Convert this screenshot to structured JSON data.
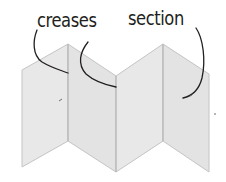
{
  "diagram": {
    "labels": {
      "creases": "creases",
      "section": "section"
    },
    "colors": {
      "panel_fill": "#e6e6e6",
      "panel_stroke": "#bdbdbd",
      "leader_line": "#231f20",
      "text": "#231f20",
      "background": "#ffffff"
    },
    "panels": [
      {
        "id": 1,
        "points": "22,70 68,44 68,141 22,167"
      },
      {
        "id": 2,
        "points": "68,44 116,76 116,172 68,141"
      },
      {
        "id": 3,
        "points": "116,76 163,44 163,141 116,172"
      },
      {
        "id": 4,
        "points": "163,44 209,74 209,172 163,141"
      }
    ],
    "crease_count": 3,
    "section_count": 4
  }
}
